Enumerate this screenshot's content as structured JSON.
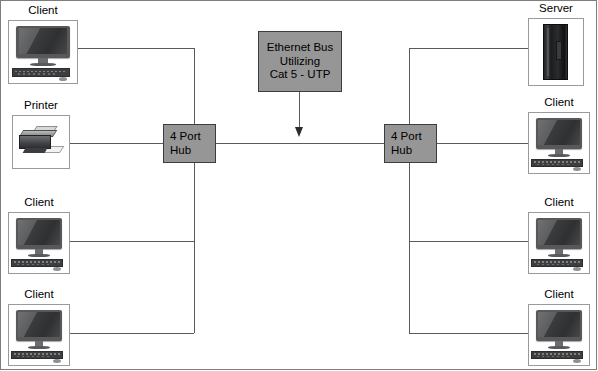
{
  "diagram": {
    "colors": {
      "box_fill": "#969696",
      "box_border": "#3d3d3d",
      "wire": "#5a5a5a",
      "frame": "#7d7d7d",
      "device_border": "#9a9a9a",
      "background": "#ffffff"
    }
  },
  "bus_caption": {
    "name": "ethernet-bus-caption",
    "lines": [
      "Ethernet Bus",
      "Utilizing",
      "Cat 5 - UTP"
    ],
    "line1": "Ethernet Bus",
    "line2": "Utilizing",
    "line3": "Cat 5 - UTP",
    "arrow": "down-arrow"
  },
  "hubs": [
    {
      "id": "left-hub",
      "line1": "4 Port",
      "line2": "Hub",
      "side": "left"
    },
    {
      "id": "right-hub",
      "line1": "4 Port",
      "line2": "Hub",
      "side": "right"
    }
  ],
  "nodes": {
    "left": [
      {
        "id": "left-client-top",
        "label": "Client",
        "icon": "desktop-computer-icon"
      },
      {
        "id": "left-printer",
        "label": "Printer",
        "icon": "printer-icon"
      },
      {
        "id": "left-client-middle",
        "label": "Client",
        "icon": "desktop-computer-icon"
      },
      {
        "id": "left-client-bottom",
        "label": "Client",
        "icon": "desktop-computer-icon"
      }
    ],
    "right": [
      {
        "id": "right-server",
        "label": "Server",
        "icon": "server-tower-icon"
      },
      {
        "id": "right-client-upper",
        "label": "Client",
        "icon": "desktop-computer-icon"
      },
      {
        "id": "right-client-middle",
        "label": "Client",
        "icon": "desktop-computer-icon"
      },
      {
        "id": "right-client-bottom",
        "label": "Client",
        "icon": "desktop-computer-icon"
      }
    ]
  }
}
